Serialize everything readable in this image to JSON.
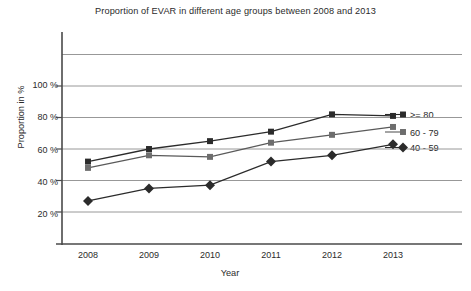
{
  "chart_data": {
    "type": "line",
    "title": "Proportion of EVAR in different age groups between 2008 and 2013",
    "xlabel": "Year",
    "ylabel": "Proportion in %",
    "categories": [
      "2008",
      "2009",
      "2010",
      "2011",
      "2012",
      "2013"
    ],
    "x": [
      2008,
      2009,
      2010,
      2011,
      2012,
      2013
    ],
    "ylim": [
      0,
      130
    ],
    "yticks": [
      20,
      40,
      60,
      80,
      100
    ],
    "ytick_labels": [
      "20 %",
      "40 %",
      "60 %",
      "80 %",
      "100 %"
    ],
    "grid": true,
    "gridlines_y": [
      20,
      40,
      60,
      80,
      100,
      120
    ],
    "legend_position": "right-inline",
    "series": [
      {
        "name": ">= 80",
        "marker": "square",
        "color": "#2b2b2b",
        "values": [
          52,
          60,
          65,
          71,
          82,
          81
        ]
      },
      {
        "name": "60 - 79",
        "marker": "square",
        "color": "#6d6d6d",
        "values": [
          48,
          56,
          55,
          64,
          69,
          74
        ]
      },
      {
        "name": "40 - 59",
        "marker": "diamond",
        "color": "#2b2b2b",
        "values": [
          27,
          35,
          37,
          52,
          56,
          63
        ]
      }
    ]
  },
  "axis": {
    "y_ticks": [
      {
        "label": "100 %"
      },
      {
        "label": "80 %"
      },
      {
        "label": "60 %"
      },
      {
        "label": "40 %"
      },
      {
        "label": "20 %"
      }
    ],
    "x_ticks": [
      {
        "label": "2008"
      },
      {
        "label": "2009"
      },
      {
        "label": "2010"
      },
      {
        "label": "2011"
      },
      {
        "label": "2012"
      },
      {
        "label": "2013"
      }
    ]
  },
  "legend": {
    "items": [
      {
        "label": ">= 80"
      },
      {
        "label": "60 - 79"
      },
      {
        "label": "40 - 59"
      }
    ]
  },
  "colors": {
    "axis": "#4a4a4a",
    "grid": "#8c8c8c",
    "series_dark": "#2b2b2b",
    "series_gray": "#6d6d6d",
    "background": "#ffffff"
  }
}
